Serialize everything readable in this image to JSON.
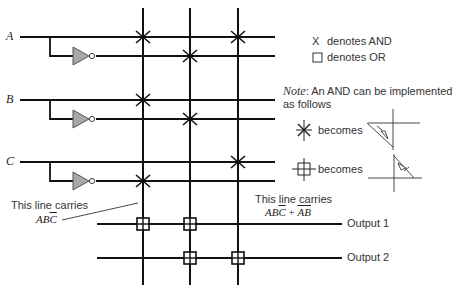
{
  "inputs": [
    {
      "label": "A",
      "y": 37,
      "inv_y": 56
    },
    {
      "label": "B",
      "y": 100,
      "inv_y": 119
    },
    {
      "label": "C",
      "y": 162,
      "inv_y": 181
    }
  ],
  "columns_x": [
    143,
    190,
    238
  ],
  "and_marks": [
    {
      "row": "A",
      "col": 1
    },
    {
      "row": "A",
      "col": 3
    },
    {
      "row": "A_bar",
      "col": 2
    },
    {
      "row": "B",
      "col": 1
    },
    {
      "row": "B_bar",
      "col": 2
    },
    {
      "row": "C",
      "col": 3
    },
    {
      "row": "C_bar",
      "col": 1
    }
  ],
  "or_marks": [
    {
      "output": 1,
      "col": 1
    },
    {
      "output": 1,
      "col": 2
    },
    {
      "output": 2,
      "col": 2
    },
    {
      "output": 2,
      "col": 3
    }
  ],
  "legend": {
    "and_symbol": "X",
    "and_text": "denotes AND",
    "or_symbol": "□",
    "or_text": "denotes OR"
  },
  "note": {
    "prefix": "Note",
    "text": ":  An AND can be implemented",
    "text2": "as follows",
    "becomes1": "becomes",
    "becomes2": "becomes"
  },
  "annotation_left": {
    "line1": "This line carries",
    "expr_main": "AB",
    "expr_bar": "C"
  },
  "annotation_right": {
    "line1": "This line carries",
    "expr_a": "AB",
    "expr_a_bar": "C",
    "plus": " + ",
    "expr_b_bar": "AB"
  },
  "outputs": [
    {
      "label": "Output 1",
      "y": 224
    },
    {
      "label": "Output 2",
      "y": 258
    }
  ]
}
